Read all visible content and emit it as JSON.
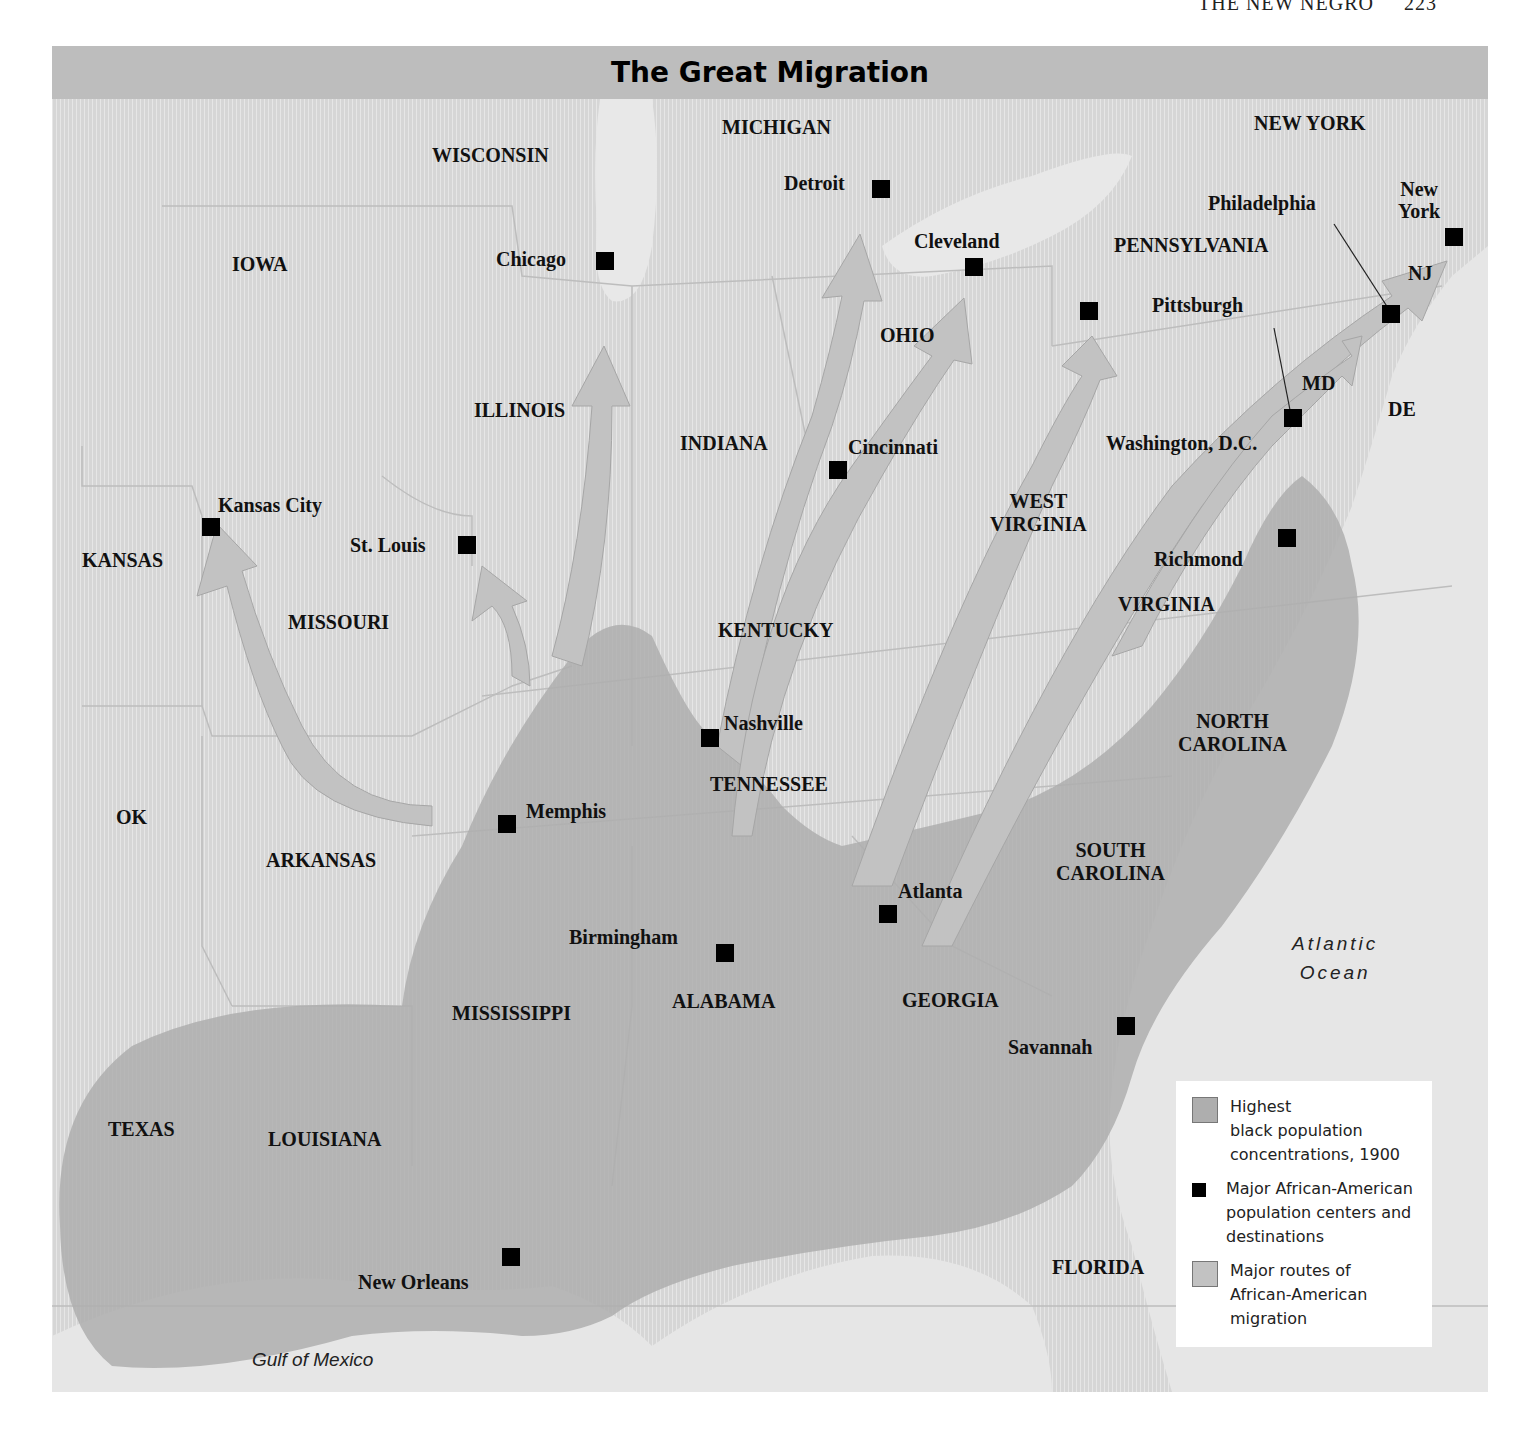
{
  "running_head": {
    "text": "THE NEW NEGRO",
    "page": "223"
  },
  "title": "The Great Migration",
  "states": [
    {
      "name": "WISCONSIN",
      "x": 380,
      "y": 98
    },
    {
      "name": "MICHIGAN",
      "x": 670,
      "y": 70
    },
    {
      "name": "NEW YORK",
      "x": 1202,
      "y": 66
    },
    {
      "name": "IOWA",
      "x": 180,
      "y": 207
    },
    {
      "name": "PENNSYLVANIA",
      "x": 1062,
      "y": 188
    },
    {
      "name": "NJ",
      "x": 1356,
      "y": 216
    },
    {
      "name": "OHIO",
      "x": 828,
      "y": 278
    },
    {
      "name": "MD",
      "x": 1250,
      "y": 326
    },
    {
      "name": "DE",
      "x": 1336,
      "y": 352
    },
    {
      "name": "ILLINOIS",
      "x": 422,
      "y": 353
    },
    {
      "name": "INDIANA",
      "x": 628,
      "y": 386
    },
    {
      "name": "WEST\nVIRGINIA",
      "x": 938,
      "y": 444
    },
    {
      "name": "KANSAS",
      "x": 30,
      "y": 503
    },
    {
      "name": "MISSOURI",
      "x": 236,
      "y": 565
    },
    {
      "name": "KENTUCKY",
      "x": 666,
      "y": 573
    },
    {
      "name": "VIRGINIA",
      "x": 1066,
      "y": 547
    },
    {
      "name": "NORTH\nCAROLINA",
      "x": 1126,
      "y": 664
    },
    {
      "name": "TENNESSEE",
      "x": 658,
      "y": 727
    },
    {
      "name": "OK",
      "x": 64,
      "y": 760
    },
    {
      "name": "ARKANSAS",
      "x": 214,
      "y": 803
    },
    {
      "name": "SOUTH\nCAROLINA",
      "x": 1004,
      "y": 793
    },
    {
      "name": "MISSISSIPPI",
      "x": 400,
      "y": 956
    },
    {
      "name": "ALABAMA",
      "x": 620,
      "y": 944
    },
    {
      "name": "GEORGIA",
      "x": 850,
      "y": 943
    },
    {
      "name": "TEXAS",
      "x": 56,
      "y": 1072
    },
    {
      "name": "LOUISIANA",
      "x": 216,
      "y": 1082
    },
    {
      "name": "FLORIDA",
      "x": 1000,
      "y": 1210
    }
  ],
  "cities": [
    {
      "name": "Detroit",
      "lx": 732,
      "ly": 126,
      "sx": 820,
      "sy": 134
    },
    {
      "name": "Chicago",
      "lx": 444,
      "ly": 202,
      "sx": 544,
      "sy": 206
    },
    {
      "name": "Cleveland",
      "lx": 862,
      "ly": 184,
      "sx": 913,
      "sy": 212
    },
    {
      "name": "Philadelphia",
      "lx": 1156,
      "ly": 146,
      "sx": 1330,
      "sy": 259
    },
    {
      "name": "New\nYork",
      "lx": 1346,
      "ly": 132,
      "sx": 1393,
      "sy": 182
    },
    {
      "name": "Pittsburgh",
      "lx": 1100,
      "ly": 248,
      "sx": 1028,
      "sy": 256
    },
    {
      "name": "Washington, D.C.",
      "lx": 1054,
      "ly": 386,
      "sx": 1232,
      "sy": 363
    },
    {
      "name": "Cincinnati",
      "lx": 796,
      "ly": 390,
      "sx": 777,
      "sy": 415
    },
    {
      "name": "Kansas City",
      "lx": 166,
      "ly": 448,
      "sx": 150,
      "sy": 472
    },
    {
      "name": "St. Louis",
      "lx": 298,
      "ly": 488,
      "sx": 406,
      "sy": 490
    },
    {
      "name": "Richmond",
      "lx": 1102,
      "ly": 502,
      "sx": 1226,
      "sy": 483
    },
    {
      "name": "Nashville",
      "lx": 672,
      "ly": 666,
      "sx": 649,
      "sy": 683
    },
    {
      "name": "Memphis",
      "lx": 474,
      "ly": 754,
      "sx": 446,
      "sy": 769
    },
    {
      "name": "Atlanta",
      "lx": 846,
      "ly": 834,
      "sx": 827,
      "sy": 859
    },
    {
      "name": "Birmingham",
      "lx": 517,
      "ly": 880,
      "sx": 664,
      "sy": 898
    },
    {
      "name": "Savannah",
      "lx": 956,
      "ly": 990,
      "sx": 1065,
      "sy": 971
    },
    {
      "name": "New Orleans",
      "lx": 306,
      "ly": 1225,
      "sx": 450,
      "sy": 1202
    }
  ],
  "water": {
    "atlantic": "Atlantic\nOcean",
    "gulf": "Gulf of Mexico"
  },
  "legend": {
    "items": [
      {
        "label": "Highest\nblack population\nconcentrations, 1900",
        "swatch": "concentration"
      },
      {
        "label": "Major African-American\npopulation centers and\ndestinations",
        "swatch": "square"
      },
      {
        "label": "Major routes of\nAfrican-American\nmigration",
        "swatch": "route"
      }
    ]
  },
  "colors": {
    "land": "#d9d9d9",
    "water": "#e6e6e6",
    "concentration": "#aeaeae",
    "route": "#c2c2c2",
    "title_bar": "#bdbdbd",
    "marker": "#000000"
  }
}
